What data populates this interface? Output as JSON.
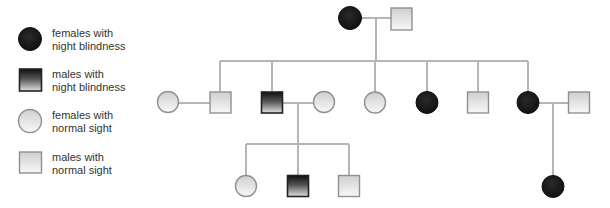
{
  "legend": {
    "items": [
      {
        "symbol": "circle",
        "status": "affected",
        "label": "females with\nnight blindness"
      },
      {
        "symbol": "square",
        "status": "affected",
        "label": "males with\nnight blindness"
      },
      {
        "symbol": "circle",
        "status": "normal",
        "label": "females with\nnormal sight"
      },
      {
        "symbol": "square",
        "status": "normal",
        "label": "males with\nnormal sight"
      }
    ]
  },
  "colors": {
    "line": "#b3b3b3",
    "affected_fill": "#1c1c1c",
    "affected_male_top": "#111111",
    "affected_male_bottom": "#d9d9d9",
    "normal_fill_top": "#d0d0d0",
    "normal_fill_bottom": "#f7f7f7",
    "normal_stroke": "#8f8f8f"
  },
  "pedigree": {
    "generations": [
      {
        "id": "I",
        "members": [
          {
            "id": "I-1",
            "sex": "female",
            "status": "affected"
          },
          {
            "id": "I-2",
            "sex": "male",
            "status": "normal"
          }
        ]
      },
      {
        "id": "II",
        "members": [
          {
            "id": "II-spouse-1",
            "sex": "female",
            "status": "normal"
          },
          {
            "id": "II-1",
            "sex": "male",
            "status": "normal"
          },
          {
            "id": "II-2",
            "sex": "male",
            "status": "affected"
          },
          {
            "id": "II-spouse-2",
            "sex": "female",
            "status": "normal"
          },
          {
            "id": "II-3",
            "sex": "female",
            "status": "normal"
          },
          {
            "id": "II-4",
            "sex": "female",
            "status": "affected"
          },
          {
            "id": "II-5",
            "sex": "male",
            "status": "normal"
          },
          {
            "id": "II-6",
            "sex": "female",
            "status": "affected"
          },
          {
            "id": "II-spouse-3",
            "sex": "male",
            "status": "normal"
          }
        ]
      },
      {
        "id": "III",
        "members": [
          {
            "id": "III-1",
            "sex": "female",
            "status": "normal"
          },
          {
            "id": "III-2",
            "sex": "male",
            "status": "affected"
          },
          {
            "id": "III-3",
            "sex": "male",
            "status": "normal"
          },
          {
            "id": "III-4",
            "sex": "female",
            "status": "affected"
          }
        ]
      }
    ]
  }
}
